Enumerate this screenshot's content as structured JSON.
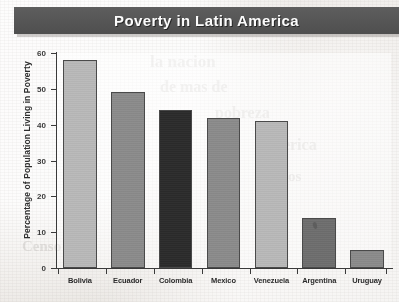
{
  "title": "Poverty in Latin America",
  "chart_data": {
    "type": "bar",
    "title": "Poverty in Latin America",
    "xlabel": "",
    "ylabel": "Percentage of Population Living in Poverty",
    "categories": [
      "Bolivia",
      "Ecuador",
      "Colombia",
      "Mexico",
      "Venezuela",
      "Argentina",
      "Uruguay"
    ],
    "values": [
      58,
      49,
      44,
      42,
      41,
      14,
      5
    ],
    "bar_colors": [
      "#b9b9b9",
      "#8b8b8b",
      "#2b2b2b",
      "#8b8b8b",
      "#b9b9b9",
      "#6e6e6e",
      "#8b8b8b"
    ],
    "ylim": [
      0,
      60
    ],
    "yticks": [
      0,
      10,
      20,
      30,
      40,
      50,
      60
    ],
    "ytick_labels": [
      "0",
      "10",
      "20",
      "30",
      "40",
      "50",
      "60"
    ],
    "grid": false,
    "legend": "none"
  },
  "colors": {
    "banner": "#565656",
    "banner_text": "#fbfbfb",
    "axis": "#3a3a3a",
    "page": "#eeebe8"
  },
  "bleed_text": {
    "l1": "la nacion",
    "l2": "de mas de",
    "l3": "pobreza",
    "l4": "America",
    "l5": "en los",
    "l6": "Censo"
  }
}
